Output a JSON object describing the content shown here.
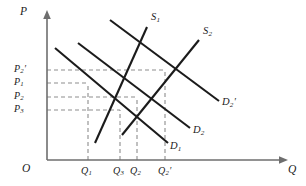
{
  "figure": {
    "kind": "supply-demand-diagram",
    "background_color": "#ffffff",
    "curve_color": "#1b1b1b",
    "axis_color": "#6e6e6e",
    "guide_color": "#8d8d8d"
  },
  "axes": {
    "y_axis_label": "P",
    "x_axis_label": "Q",
    "origin_label": "O"
  },
  "price_ticks": [
    {
      "id": "p2prime",
      "base": "P",
      "sub": "2",
      "prime": "′",
      "y": 70
    },
    {
      "id": "p1",
      "base": "P",
      "sub": "1",
      "prime": "",
      "y": 83
    },
    {
      "id": "p2",
      "base": "P",
      "sub": "2",
      "prime": "",
      "y": 97
    },
    {
      "id": "p3",
      "base": "P",
      "sub": "3",
      "prime": "",
      "y": 110
    }
  ],
  "quantity_ticks": [
    {
      "id": "q1",
      "base": "Q",
      "sub": "1",
      "prime": "",
      "x": 88
    },
    {
      "id": "q3",
      "base": "Q",
      "sub": "3",
      "prime": "",
      "x": 120
    },
    {
      "id": "q2",
      "base": "Q",
      "sub": "2",
      "prime": "",
      "x": 137
    },
    {
      "id": "q2prime",
      "base": "Q",
      "sub": "2",
      "prime": "′",
      "x": 165
    }
  ],
  "supply_curves": [
    {
      "id": "s1",
      "base": "S",
      "sub": "1",
      "prime": "",
      "x1": 95,
      "y1": 143,
      "x2": 147,
      "y2": 27
    },
    {
      "id": "s2",
      "base": "S",
      "sub": "2",
      "prime": "",
      "x1": 122,
      "y1": 135,
      "x2": 199,
      "y2": 40
    }
  ],
  "demand_curves": [
    {
      "id": "d1",
      "base": "D",
      "sub": "1",
      "prime": "",
      "x1": 55,
      "y1": 48,
      "x2": 168,
      "y2": 143
    },
    {
      "id": "d2",
      "base": "D",
      "sub": "2",
      "prime": "",
      "x1": 78,
      "y1": 43,
      "x2": 190,
      "y2": 128
    },
    {
      "id": "d2prime",
      "base": "D",
      "sub": "2",
      "prime": "′",
      "x1": 110,
      "y1": 20,
      "x2": 219,
      "y2": 101
    }
  ],
  "chart_data": {
    "type": "line",
    "title": "",
    "xlabel": "Q",
    "ylabel": "P",
    "grid": false,
    "legend": "inline-curve-labels",
    "series": [
      {
        "name": "S₁",
        "role": "supply",
        "slope": "positive",
        "points": [
          [
            95,
            143
          ],
          [
            147,
            27
          ]
        ]
      },
      {
        "name": "S₂",
        "role": "supply",
        "slope": "positive",
        "points": [
          [
            122,
            135
          ],
          [
            199,
            40
          ]
        ]
      },
      {
        "name": "D₁",
        "role": "demand",
        "slope": "negative",
        "points": [
          [
            55,
            48
          ],
          [
            168,
            143
          ]
        ]
      },
      {
        "name": "D₂",
        "role": "demand",
        "slope": "negative",
        "points": [
          [
            78,
            43
          ],
          [
            190,
            128
          ]
        ]
      },
      {
        "name": "D₂′",
        "role": "demand",
        "slope": "negative",
        "points": [
          [
            110,
            20
          ],
          [
            219,
            101
          ]
        ]
      }
    ],
    "equilibria": [
      {
        "label": "(Q₁, P₁)",
        "x": 88,
        "y": 83,
        "supply": "S₁",
        "demand": "D₂"
      },
      {
        "label": "(Q₃, P₃)",
        "x": 120,
        "y": 110,
        "supply": "S₁",
        "demand": "D₁"
      },
      {
        "label": "(Q₂, P₂)",
        "x": 137,
        "y": 97,
        "supply": "S₂",
        "demand": "D₂"
      },
      {
        "label": "(Q₂′, P₂′)",
        "x": 165,
        "y": 70,
        "supply": "S₂",
        "demand": "D₂′"
      }
    ],
    "price_tick_labels": [
      "P₂′",
      "P₁",
      "P₂",
      "P₃"
    ],
    "quantity_tick_labels": [
      "Q₁",
      "Q₃",
      "Q₂",
      "Q₂′"
    ]
  }
}
